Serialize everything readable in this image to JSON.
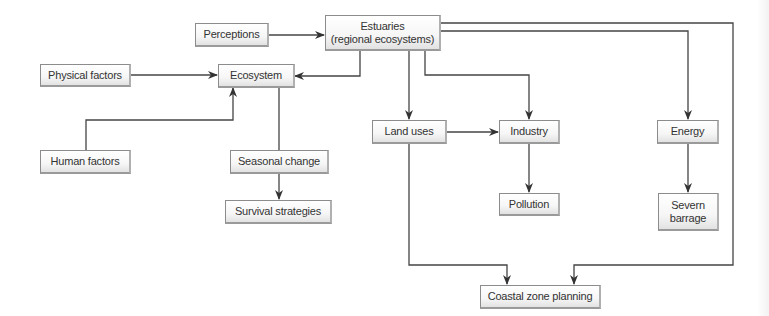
{
  "diagram": {
    "nodes": [
      {
        "id": "perceptions",
        "label": "Perceptions"
      },
      {
        "id": "estuaries",
        "label": "Estuaries\n(regional ecosystems)"
      },
      {
        "id": "physical_factors",
        "label": "Physical factors"
      },
      {
        "id": "ecosystem",
        "label": "Ecosystem"
      },
      {
        "id": "human_factors",
        "label": "Human factors"
      },
      {
        "id": "seasonal_change",
        "label": "Seasonal change"
      },
      {
        "id": "survival_strategies",
        "label": "Survival strategies"
      },
      {
        "id": "land_uses",
        "label": "Land uses"
      },
      {
        "id": "industry",
        "label": "Industry"
      },
      {
        "id": "pollution",
        "label": "Pollution"
      },
      {
        "id": "energy",
        "label": "Energy"
      },
      {
        "id": "severn_barrage",
        "label": "Severn\nbarrage"
      },
      {
        "id": "coastal_zone_planning",
        "label": "Coastal zone planning"
      }
    ],
    "edges": [
      {
        "from": "perceptions",
        "to": "estuaries"
      },
      {
        "from": "physical_factors",
        "to": "ecosystem"
      },
      {
        "from": "estuaries",
        "to": "ecosystem"
      },
      {
        "from": "human_factors",
        "to": "ecosystem"
      },
      {
        "from": "ecosystem",
        "to": "seasonal_change"
      },
      {
        "from": "seasonal_change",
        "to": "survival_strategies"
      },
      {
        "from": "estuaries",
        "to": "land_uses"
      },
      {
        "from": "estuaries",
        "to": "industry"
      },
      {
        "from": "land_uses",
        "to": "industry"
      },
      {
        "from": "industry",
        "to": "pollution"
      },
      {
        "from": "estuaries",
        "to": "energy"
      },
      {
        "from": "energy",
        "to": "severn_barrage"
      },
      {
        "from": "land_uses",
        "to": "coastal_zone_planning"
      },
      {
        "from": "estuaries",
        "to": "coastal_zone_planning"
      }
    ],
    "colors": {
      "line": "#333333",
      "box_border": "#8c8c8c",
      "text": "#333333"
    }
  }
}
